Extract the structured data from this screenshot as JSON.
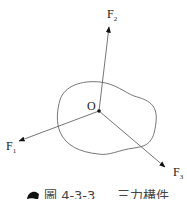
{
  "diagram": {
    "point_label": "O",
    "forces": [
      {
        "name": "F",
        "sub": "1"
      },
      {
        "name": "F",
        "sub": "2"
      },
      {
        "name": "F",
        "sub": "3"
      }
    ],
    "colors": {
      "stroke": "#555555",
      "text": "#222222"
    }
  },
  "caption": {
    "icon": "book-icon",
    "figure_number": "圖 4-3-3",
    "text": "三力構件"
  }
}
